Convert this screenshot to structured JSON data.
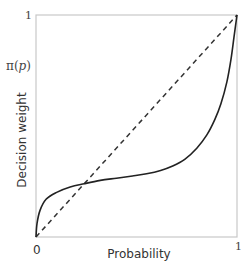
{
  "chart_data": {
    "type": "line",
    "title": "",
    "xlabel": "Probability",
    "ylabel": "Decision weight",
    "ylabel_symbol": "π(p)",
    "xlim": [
      0,
      1
    ],
    "ylim": [
      0,
      1
    ],
    "x_ticks": [
      "0",
      "1"
    ],
    "y_ticks": [
      "1"
    ],
    "grid": false,
    "legend": null,
    "series": [
      {
        "name": "Decision weight π(p)",
        "style": "solid",
        "color": "#222222",
        "x": [
          0,
          0.005,
          0.02,
          0.05,
          0.1,
          0.17,
          0.24,
          0.32,
          0.4,
          0.48,
          0.55,
          0.62,
          0.68,
          0.74,
          0.8,
          0.85,
          0.89,
          0.92,
          0.95,
          0.97,
          0.985,
          1.0
        ],
        "y": [
          0,
          0.06,
          0.12,
          0.17,
          0.2,
          0.225,
          0.24,
          0.255,
          0.265,
          0.275,
          0.285,
          0.3,
          0.32,
          0.35,
          0.4,
          0.46,
          0.53,
          0.6,
          0.7,
          0.8,
          0.9,
          1.0
        ]
      },
      {
        "name": "Identity (p)",
        "style": "dashed",
        "color": "#333333",
        "x": [
          0,
          1
        ],
        "y": [
          0,
          1
        ]
      }
    ]
  },
  "labels": {
    "y_top_tick": "1",
    "y_symbol_prefix": "π(",
    "y_symbol_var": "p",
    "y_symbol_suffix": ")",
    "y_axis_title": "Decision weight",
    "x_zero_tick": "0",
    "x_one_tick": "1",
    "x_axis_title": "Probability"
  },
  "plot_box": {
    "left": 36,
    "top": 15,
    "right": 237,
    "bottom": 237
  }
}
